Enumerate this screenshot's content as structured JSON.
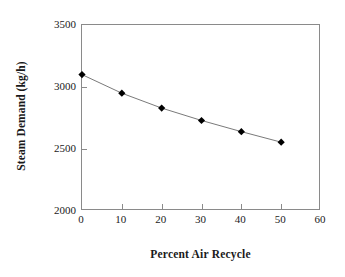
{
  "chart_data": {
    "type": "line",
    "title": "",
    "xlabel": "Percent Air Recycle",
    "ylabel": "Steam Demand (kg/h)",
    "x": [
      0,
      10,
      20,
      30,
      40,
      50
    ],
    "values": [
      3100,
      2950,
      2830,
      2730,
      2640,
      2555
    ],
    "series": [
      {
        "name": "Steam Demand",
        "x": [
          0,
          10,
          20,
          30,
          40,
          50
        ],
        "values": [
          3100,
          2950,
          2830,
          2730,
          2640,
          2555
        ]
      }
    ],
    "xlim": [
      0,
      60
    ],
    "ylim": [
      2000,
      3500
    ],
    "xticks": [
      0,
      10,
      20,
      30,
      40,
      50,
      60
    ],
    "yticks": [
      2000,
      2500,
      3000,
      3500
    ],
    "xtick_labels": [
      "0",
      "10",
      "20",
      "30",
      "40",
      "50",
      "60"
    ],
    "ytick_labels": [
      "2000",
      "2500",
      "3000",
      "3500"
    ],
    "grid": false,
    "legend": false,
    "legend_position": "none",
    "marker": "diamond",
    "marker_color": "#000000",
    "line_color": "#7a7a7a",
    "axis_color": "#8a8a8a",
    "background": "#ffffff"
  },
  "axes": {
    "y_title": "Steam Demand (kg/h)",
    "x_title": "Percent Air Recycle"
  }
}
